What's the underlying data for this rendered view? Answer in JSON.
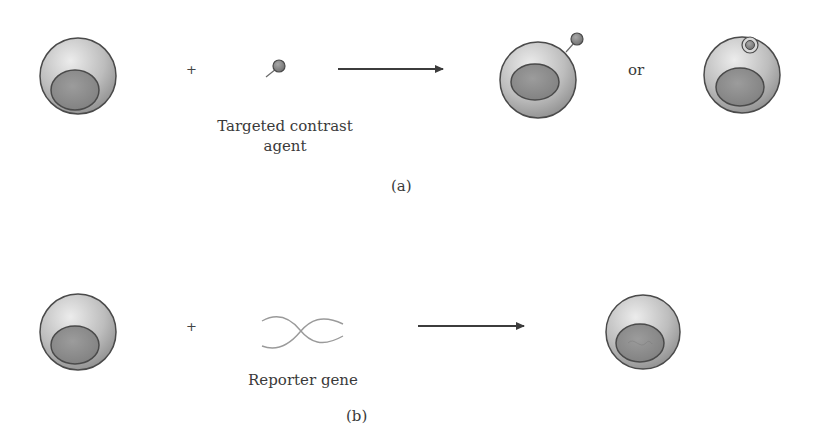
{
  "panel_a": {
    "plus": "+",
    "agent_label_line1": "Targeted contrast",
    "agent_label_line2": "agent",
    "or": "or",
    "caption": "(a)"
  },
  "panel_b": {
    "plus": "+",
    "gene_label": "Reporter gene",
    "caption": "(b)"
  },
  "colors": {
    "cell_light": "#e8e8e8",
    "cell_dark": "#8e8e8e",
    "nucleus": "#8a8a8a",
    "outline": "#4a4a4a",
    "arrow": "#3c3c3c",
    "dna": "#9a9a9a"
  }
}
